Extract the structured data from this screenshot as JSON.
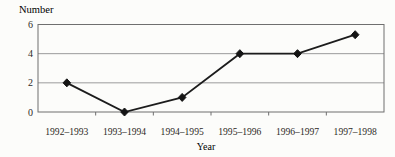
{
  "figure": {
    "background": "#fcfcfa"
  },
  "chart_data": {
    "type": "line",
    "title": "",
    "ylabel": "Number",
    "xlabel": "Year",
    "categories": [
      "1992–1993",
      "1993–1994",
      "1994–1995",
      "1995–1996",
      "1996–1997",
      "1997–1998"
    ],
    "values": [
      2,
      0,
      1,
      4,
      4,
      5.3
    ],
    "yticks": [
      0,
      2,
      4,
      6
    ],
    "ylim": [
      0,
      6
    ],
    "grid": "horizontal-only",
    "legend_position": "none",
    "marker": "diamond",
    "colors": {
      "line": "#1c1c1c",
      "marker": "#141414",
      "grid": "#9b9b9b",
      "border": "#6f6f6f",
      "text": "#2e2a26"
    }
  }
}
